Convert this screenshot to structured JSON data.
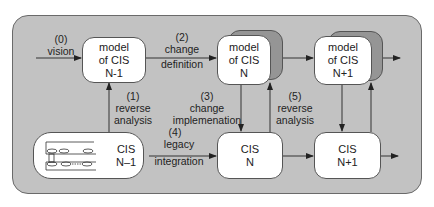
{
  "diagram": {
    "type": "flow",
    "nodes": {
      "model_n_minus_1": {
        "lines": [
          "model",
          "of CIS",
          "N-1"
        ]
      },
      "model_n": {
        "lines": [
          "model",
          "of CIS",
          "N"
        ],
        "stacked": true
      },
      "model_n_plus_1": {
        "lines": [
          "model",
          "of CIS",
          "N+1"
        ],
        "stacked": true
      },
      "cis_n_minus_1": {
        "lines": [
          "CIS",
          "N–1"
        ],
        "icon": "legacy-system-icon"
      },
      "cis_n": {
        "lines": [
          "CIS",
          "N"
        ]
      },
      "cis_n_plus_1": {
        "lines": [
          "CIS",
          "N+1"
        ]
      }
    },
    "edges": {
      "vision": {
        "num": "(0)",
        "line1": "vision",
        "from": "external",
        "to": "model_n_minus_1"
      },
      "reverse_analysis_1": {
        "num": "(1)",
        "line1": "reverse",
        "line2": "analysis",
        "from": "cis_n_minus_1",
        "to": "model_n_minus_1"
      },
      "change_definition": {
        "num": "(2)",
        "line1": "change",
        "line2": "definition",
        "from": "model_n_minus_1",
        "to": "model_n"
      },
      "change_implementation": {
        "num": "(3)",
        "line1": "change",
        "line2": "implemenation",
        "from": "model_n",
        "to": "cis_n"
      },
      "legacy_integration": {
        "num": "(4)",
        "line1": "legacy",
        "line2": "integration",
        "from": "cis_n_minus_1",
        "to": "cis_n"
      },
      "reverse_analysis_5": {
        "num": "(5)",
        "line1": "reverse",
        "line2": "analysis",
        "from": "cis_n",
        "to": "model_n"
      }
    },
    "colors": {
      "panel": "#c2c2c2",
      "box": "#ffffff",
      "stack_back": "#959595",
      "stroke": "#333333"
    }
  }
}
